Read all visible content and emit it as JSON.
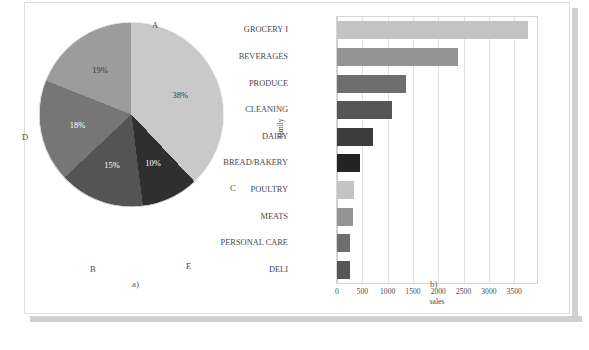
{
  "figure": {
    "panel_a_caption": "a)",
    "panel_b_caption": "b)"
  },
  "chart_data": [
    {
      "type": "pie",
      "title": "",
      "panel": "a)",
      "categories": [
        "A",
        "B",
        "C",
        "D",
        "E"
      ],
      "labels": [
        "A",
        "B",
        "C",
        "D",
        "E"
      ],
      "values": [
        38,
        18,
        10,
        19,
        15
      ],
      "value_labels": [
        "38%",
        "18%",
        "10%",
        "19%",
        "15%"
      ],
      "unit": "%",
      "colors": [
        "#c9c9c9",
        "#767676",
        "#2f2f2f",
        "#9c9c9c",
        "#545454"
      ],
      "slice_order": [
        "A",
        "C",
        "E",
        "B",
        "D"
      ],
      "legend": "none",
      "grid": false
    },
    {
      "type": "bar",
      "orientation": "horizontal",
      "panel": "b)",
      "title": "",
      "xlabel": "sales",
      "ylabel": "family",
      "categories": [
        "GROCERY I",
        "BEVERAGES",
        "PRODUCE",
        "CLEANING",
        "DAIRY",
        "BREAD/BAKERY",
        "POULTRY",
        "MEATS",
        "PERSONAL CARE",
        "DELI"
      ],
      "values": [
        3780,
        2390,
        1360,
        1080,
        710,
        450,
        330,
        320,
        260,
        255
      ],
      "colors": [
        "#c4c4c4",
        "#949494",
        "#6e6e6e",
        "#565656",
        "#3c3c3c",
        "#242424",
        "#c4c4c4",
        "#949494",
        "#6e6e6e",
        "#565656"
      ],
      "xlim": [
        0,
        3950
      ],
      "xticks": [
        0,
        500,
        1000,
        1500,
        2000,
        2500,
        3000,
        3500
      ],
      "xtick_labels": [
        "0",
        "500",
        "1000",
        "1500",
        "2000",
        "2500",
        "3000",
        "3500"
      ],
      "grid": true,
      "grid_axis": "x",
      "legend": "none"
    }
  ]
}
